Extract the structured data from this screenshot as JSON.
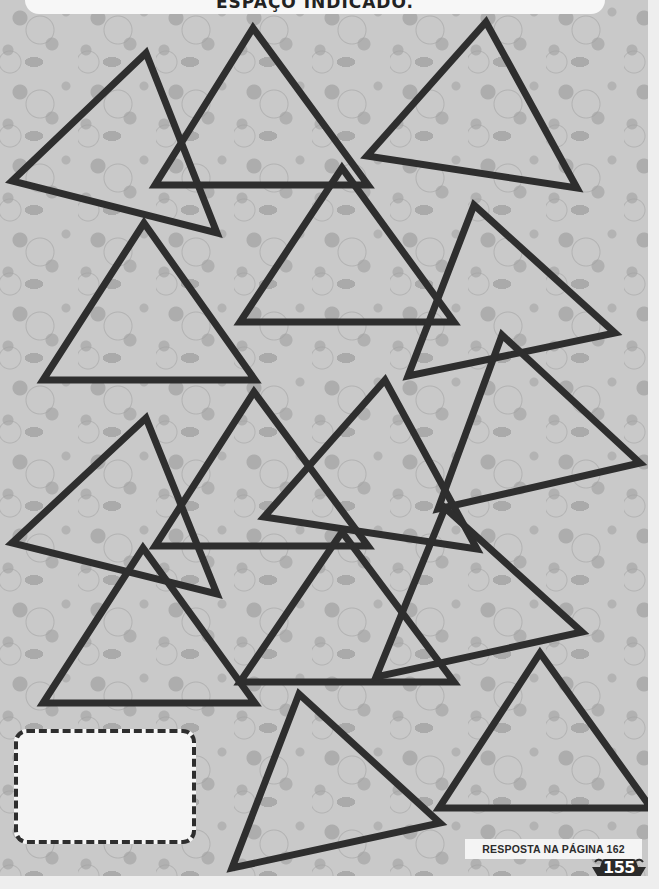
{
  "header": {
    "instruction_text": "ESPAÇO INDICADO."
  },
  "colors": {
    "page_background": "#c9c9c9",
    "pattern_blotch": "#adadad",
    "triangle_stroke": "#2e2e2e",
    "answer_box_fill": "#f6f6f6",
    "margin": "#eeeeee"
  },
  "triangles": [
    {
      "id": "A",
      "points": "146,53 12,181 217,233"
    },
    {
      "id": "B",
      "points": "253,28 155,185 368,185"
    },
    {
      "id": "C",
      "points": "486,22 367,156 577,188"
    },
    {
      "id": "D",
      "points": "144,223 43,380 255,380"
    },
    {
      "id": "E",
      "points": "342,168 240,322 454,322"
    },
    {
      "id": "F",
      "points": "474,205 408,376 615,333"
    },
    {
      "id": "G",
      "points": "502,335 438,509 640,463"
    },
    {
      "id": "H",
      "points": "146,418 12,543 217,594"
    },
    {
      "id": "I",
      "points": "254,392 155,546 368,546"
    },
    {
      "id": "K",
      "points": "385,380 264,517 477,549"
    },
    {
      "id": "J",
      "points": "143,548 43,703 255,703"
    },
    {
      "id": "L",
      "points": "342,532 240,682 454,682"
    },
    {
      "id": "M",
      "points": "445,508 376,677 582,632"
    },
    {
      "id": "N",
      "points": "540,653 439,808 651,808"
    },
    {
      "id": "O",
      "points": "299,694 232,868 440,823"
    }
  ],
  "answer_box": {
    "content": ""
  },
  "footer": {
    "answer_reference": "RESPOSTA NA PÁGINA 162",
    "page_number": "155"
  }
}
